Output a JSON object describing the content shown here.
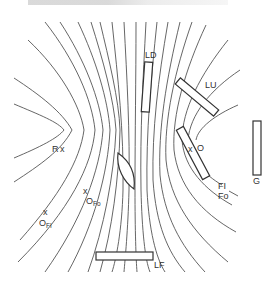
{
  "diagram": {
    "title_fragment": "",
    "labels": {
      "LD": "LD",
      "LU": "LU",
      "O": "O",
      "R": "R",
      "G": "G",
      "FI": "FI",
      "Fo": "Fo",
      "O_Fo": "O",
      "O_Fo_sub": "Fo",
      "O_FI": "O",
      "O_FI_sub": "FI",
      "LF": "LF",
      "cross": "x"
    },
    "elements": [
      {
        "id": "LD",
        "type": "plate",
        "description": "vertical thin plate, upper center"
      },
      {
        "id": "LU",
        "type": "plate",
        "description": "tilted plate, upper right"
      },
      {
        "id": "FI",
        "type": "plate",
        "description": "tilted plate near O, right"
      },
      {
        "id": "G",
        "type": "plate",
        "description": "vertical plate, far right"
      },
      {
        "id": "LF",
        "type": "plate",
        "description": "horizontal plate, bottom center"
      },
      {
        "id": "lens",
        "type": "lens",
        "description": "biconvex lens, center"
      }
    ],
    "points": [
      "R",
      "O",
      "O_Fo",
      "O_FI"
    ]
  }
}
